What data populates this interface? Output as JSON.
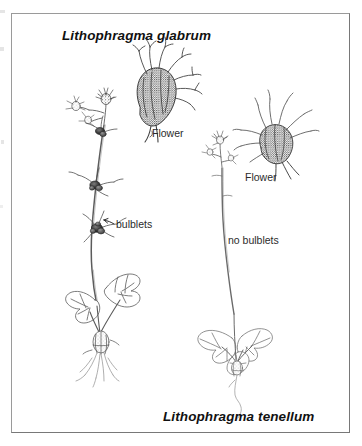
{
  "plate": {
    "width": 362,
    "height": 446,
    "background_color": "#ffffff",
    "frame_color": "#8e8e8e",
    "ink_color": "#1a1a1a"
  },
  "title": {
    "text": "Lithophragma glabrum",
    "style": "bold-italic"
  },
  "caption": {
    "text": "Lithophragma tenellum",
    "style": "bold-italic"
  },
  "annotations": [
    {
      "id": "flower-left",
      "text": "Flower"
    },
    {
      "id": "flower-right",
      "text": "Flower"
    },
    {
      "id": "bulblets",
      "text": "bulblets"
    },
    {
      "id": "no-bulblets",
      "text": "no bulblets"
    }
  ],
  "figures": {
    "left_plant": {
      "name": "Lithophragma glabrum habit drawing",
      "features": [
        "inflorescence",
        "slender stem",
        "bulblets at nodes",
        "palmately lobed basal leaves",
        "rhizome",
        "fibrous roots"
      ]
    },
    "left_flower_detail": {
      "name": "Lithophragma glabrum flower detail",
      "features": [
        "stippled calyx tube",
        "radiating fringed petals"
      ]
    },
    "right_plant": {
      "name": "Lithophragma tenellum habit drawing",
      "features": [
        "inflorescence",
        "slender bare stem",
        "no bulblets",
        "rounded basal leaves",
        "thin trailing root"
      ]
    },
    "right_flower_detail": {
      "name": "Lithophragma tenellum flower detail",
      "features": [
        "stippled rounded calyx",
        "spray of narrow petals"
      ]
    }
  }
}
